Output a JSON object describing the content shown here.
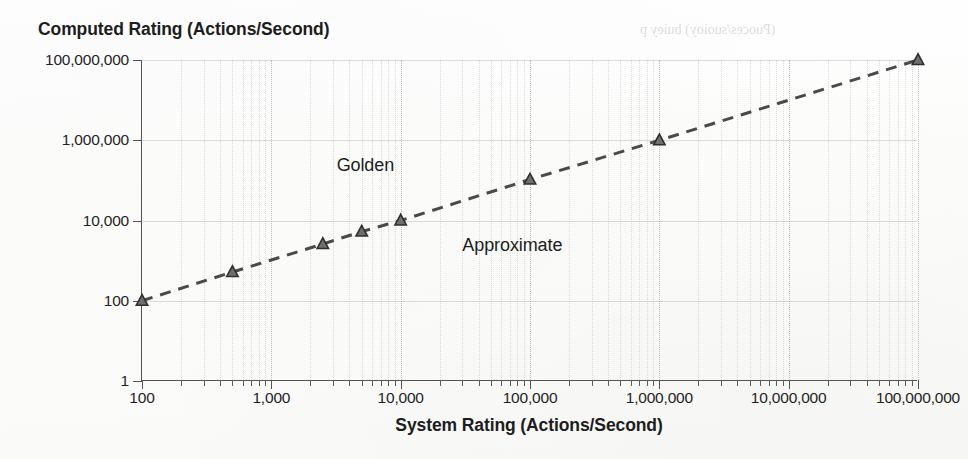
{
  "chart_data": {
    "type": "line",
    "title": "",
    "ylabel": "Computed Rating (Actions/Second)",
    "xlabel": "System Rating (Actions/Second)",
    "xscale": "log",
    "yscale": "log",
    "xlim": [
      100,
      100000000
    ],
    "ylim": [
      1,
      100000000
    ],
    "grid": true,
    "legend": "none",
    "xticks": [
      {
        "value": 100,
        "label": "100"
      },
      {
        "value": 1000,
        "label": "1,000"
      },
      {
        "value": 10000,
        "label": "10,000"
      },
      {
        "value": 100000,
        "label": "100,000"
      },
      {
        "value": 1000000,
        "label": "1,000,000"
      },
      {
        "value": 10000000,
        "label": "10,000,000"
      },
      {
        "value": 100000000,
        "label": "100,000,000"
      }
    ],
    "yticks": [
      {
        "value": 1,
        "label": "1"
      },
      {
        "value": 100,
        "label": "100"
      },
      {
        "value": 10000,
        "label": "10,000"
      },
      {
        "value": 1000000,
        "label": "1,000,000"
      },
      {
        "value": 100000000,
        "label": "100,000,000"
      }
    ],
    "series": [
      {
        "name": "Computed vs System Rating",
        "marker": "triangle",
        "linestyle": "dashed",
        "color": "#4a4a4a",
        "points": [
          {
            "x": 100,
            "y": 100
          },
          {
            "x": 500,
            "y": 520
          },
          {
            "x": 2500,
            "y": 2600
          },
          {
            "x": 5000,
            "y": 5300
          },
          {
            "x": 10000,
            "y": 10000
          },
          {
            "x": 100000,
            "y": 105000
          },
          {
            "x": 1000000,
            "y": 1000000
          },
          {
            "x": 100000000,
            "y": 100000000
          }
        ]
      }
    ],
    "annotations": [
      {
        "text": "Golden",
        "x": 3200,
        "y": 230000
      },
      {
        "text": "Approximate",
        "x": 30000,
        "y": 2300
      }
    ]
  },
  "ghost_text": {
    "top_right": "(Puoces/suoioy) buiey p",
    "mid": ""
  },
  "colors": {
    "axis": "#545454",
    "series": "#4a4a4a",
    "grid_major": "#8c8c8c",
    "grid_minor": "#a5a5a5",
    "text": "#1d1d1d",
    "background": "#fdfdfc"
  }
}
